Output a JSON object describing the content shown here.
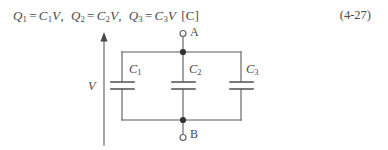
{
  "equation": {
    "terms": [
      {
        "charge": "Q",
        "charge_sub": "1",
        "eq": "=",
        "cap": "C",
        "cap_sub": "1",
        "volt": "V",
        "sep": ","
      },
      {
        "charge": "Q",
        "charge_sub": "2",
        "eq": "=",
        "cap": "C",
        "cap_sub": "2",
        "volt": "V",
        "sep": ","
      },
      {
        "charge": "Q",
        "charge_sub": "3",
        "eq": "=",
        "cap": "C",
        "cap_sub": "3",
        "volt": "V",
        "sep": ""
      }
    ],
    "unit": "[C]",
    "number": "(4-27)"
  },
  "circuit": {
    "title": "three capacitors in parallel across voltage V",
    "source_label": "V",
    "terminal_top": "A",
    "terminal_bottom": "B",
    "capacitors": [
      {
        "symbol": "C",
        "sub": "1"
      },
      {
        "symbol": "C",
        "sub": "2"
      },
      {
        "symbol": "C",
        "sub": "3"
      }
    ],
    "colors": {
      "line": "#5a5a5a",
      "node": "#333333",
      "text": "#4a4a4a",
      "background": "#ffffff"
    }
  }
}
